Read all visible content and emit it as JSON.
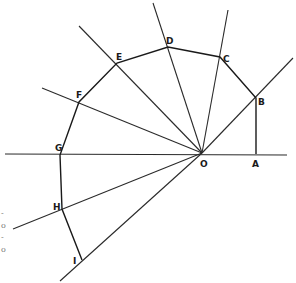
{
  "diagram": {
    "center": {
      "label": "O",
      "x": 202,
      "y": 153
    },
    "baseline": {
      "x1": 5,
      "y1": 154,
      "x2": 287,
      "y2": 155
    },
    "vertices": [
      {
        "label": "A",
        "x": 256,
        "y": 154,
        "lx": 252,
        "ly": 167
      },
      {
        "label": "B",
        "x": 256,
        "y": 98,
        "lx": 258,
        "ly": 105
      },
      {
        "label": "C",
        "x": 220,
        "y": 57,
        "lx": 223,
        "ly": 62
      },
      {
        "label": "D",
        "x": 168,
        "y": 47,
        "lx": 166,
        "ly": 44
      },
      {
        "label": "E",
        "x": 117,
        "y": 63,
        "lx": 116,
        "ly": 60
      },
      {
        "label": "F",
        "x": 79,
        "y": 102,
        "lx": 76,
        "ly": 98
      },
      {
        "label": "G",
        "x": 60,
        "y": 155,
        "lx": 55,
        "ly": 151
      },
      {
        "label": "H",
        "x": 62,
        "y": 209,
        "lx": 53,
        "ly": 210
      },
      {
        "label": "I",
        "x": 82,
        "y": 260,
        "lx": 73,
        "ly": 264
      }
    ],
    "rays": [
      {
        "name": "ray-OB",
        "x1": 202,
        "y1": 153,
        "x2": 293,
        "y2": 58
      },
      {
        "name": "ray-OC",
        "x1": 202,
        "y1": 153,
        "x2": 228,
        "y2": 10
      },
      {
        "name": "ray-OD",
        "x1": 202,
        "y1": 153,
        "x2": 153,
        "y2": 3
      },
      {
        "name": "ray-OE",
        "x1": 202,
        "y1": 153,
        "x2": 79,
        "y2": 26
      },
      {
        "name": "ray-OF",
        "x1": 202,
        "y1": 153,
        "x2": 42,
        "y2": 88
      },
      {
        "name": "ray-OH",
        "x1": 202,
        "y1": 153,
        "x2": 13,
        "y2": 229
      },
      {
        "name": "ray-OI",
        "x1": 202,
        "y1": 153,
        "x2": 60,
        "y2": 281
      }
    ],
    "margin_marks": [
      "-",
      "o",
      "-",
      "o"
    ]
  }
}
